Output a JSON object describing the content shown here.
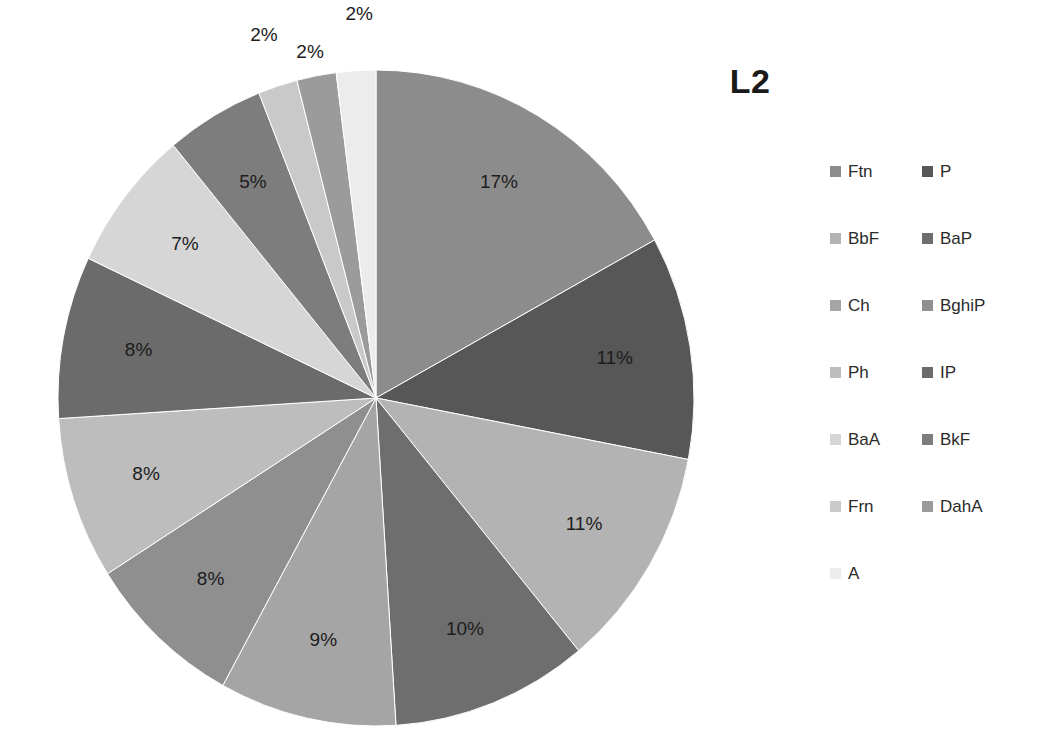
{
  "chart_data": {
    "type": "pie",
    "title": "L2",
    "xlabel": "",
    "ylabel": "",
    "legend_position": "right",
    "grid": false,
    "labels_format": "percent",
    "start_angle_deg": 0,
    "direction": "clockwise",
    "categories": [
      "Ftn",
      "P",
      "BbF",
      "BaP",
      "Ch",
      "BghiP",
      "Ph",
      "IP",
      "BaA",
      "BkF",
      "Frn",
      "DahA",
      "A"
    ],
    "values": [
      17,
      11,
      11,
      10,
      9,
      8,
      8,
      8,
      7,
      5,
      2,
      2,
      2
    ],
    "data_labels": [
      "17%",
      "11%",
      "11%",
      "10%",
      "9%",
      "8%",
      "8%",
      "8%",
      "7%",
      "5%",
      "2%",
      "2%",
      "2%"
    ],
    "colors": [
      "#8c8c8c",
      "#575757",
      "#b3b3b3",
      "#6e6e6e",
      "#a5a5a5",
      "#8f8f8f",
      "#bdbdbd",
      "#6b6b6b",
      "#d6d6d6",
      "#7d7d7d",
      "#c9c9c9",
      "#9b9b9b",
      "#ececec"
    ],
    "slices": [
      {
        "label": "Ftn",
        "value": 17,
        "data_label": "17%",
        "color": "#8c8c8c"
      },
      {
        "label": "P",
        "value": 11,
        "data_label": "11%",
        "color": "#575757"
      },
      {
        "label": "BbF",
        "value": 11,
        "data_label": "11%",
        "color": "#b3b3b3"
      },
      {
        "label": "BaP",
        "value": 10,
        "data_label": "10%",
        "color": "#6e6e6e"
      },
      {
        "label": "Ch",
        "value": 9,
        "data_label": "9%",
        "color": "#a5a5a5"
      },
      {
        "label": "BghiP",
        "value": 8,
        "data_label": "8%",
        "color": "#8f8f8f"
      },
      {
        "label": "Ph",
        "value": 8,
        "data_label": "8%",
        "color": "#bdbdbd"
      },
      {
        "label": "IP",
        "value": 8,
        "data_label": "8%",
        "color": "#6b6b6b"
      },
      {
        "label": "BaA",
        "value": 7,
        "data_label": "7%",
        "color": "#d6d6d6"
      },
      {
        "label": "BkF",
        "value": 5,
        "data_label": "5%",
        "color": "#7d7d7d"
      },
      {
        "label": "Frn",
        "value": 2,
        "data_label": "2%",
        "color": "#c9c9c9"
      },
      {
        "label": "DahA",
        "value": 2,
        "data_label": "2%",
        "color": "#9b9b9b"
      },
      {
        "label": "A",
        "value": 2,
        "data_label": "2%",
        "color": "#ececec"
      }
    ]
  },
  "legend": {
    "items": [
      {
        "label": "Ftn",
        "color": "#8c8c8c"
      },
      {
        "label": "P",
        "color": "#575757"
      },
      {
        "label": "BbF",
        "color": "#b3b3b3"
      },
      {
        "label": "BaP",
        "color": "#6e6e6e"
      },
      {
        "label": "Ch",
        "color": "#a5a5a5"
      },
      {
        "label": "BghiP",
        "color": "#8f8f8f"
      },
      {
        "label": "Ph",
        "color": "#bdbdbd"
      },
      {
        "label": "IP",
        "color": "#6b6b6b"
      },
      {
        "label": "BaA",
        "color": "#d6d6d6"
      },
      {
        "label": "BkF",
        "color": "#7d7d7d"
      },
      {
        "label": "Frn",
        "color": "#c9c9c9"
      },
      {
        "label": "DahA",
        "color": "#9b9b9b"
      },
      {
        "label": "A",
        "color": "#ececec"
      }
    ]
  },
  "geometry": {
    "center_x": 376,
    "center_y": 398,
    "radius_x": 318,
    "radius_y": 328,
    "label_radius_factor": 0.76,
    "small_slice_label_factor": 1.14
  }
}
